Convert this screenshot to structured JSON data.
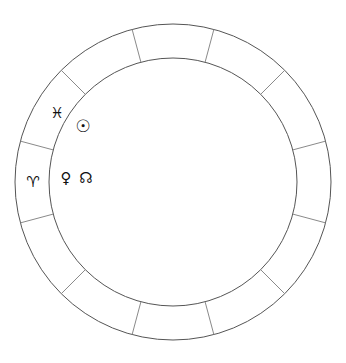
{
  "chart": {
    "wheel": {
      "center_x": 173,
      "center_y": 182,
      "outer_radius": 158,
      "inner_radius": 124,
      "sector_count": 12,
      "sector_span_degrees": 30,
      "rotation_offset_degrees": 15,
      "outer_ring_color": "#555555",
      "inner_ring_color": "#555555",
      "divider_color": "#8a8a8a",
      "background_color": "#ffffff"
    },
    "signs": [
      {
        "name": "pisces",
        "label": "♓",
        "x": 57,
        "y": 113
      },
      {
        "name": "aries",
        "label": "♈",
        "x": 33,
        "y": 182
      }
    ],
    "planets": [
      {
        "name": "sun",
        "label": "☉",
        "x": 83,
        "y": 126
      },
      {
        "name": "venus",
        "label": "♀",
        "x": 66,
        "y": 178
      },
      {
        "name": "north-node",
        "label": "☊",
        "x": 86,
        "y": 178
      }
    ]
  }
}
